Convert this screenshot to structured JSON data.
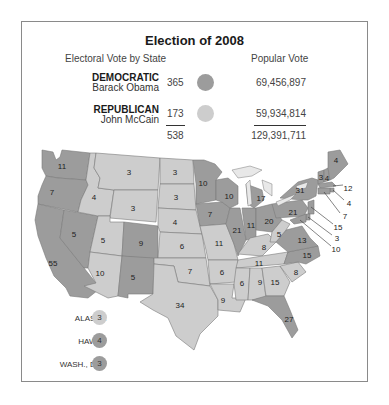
{
  "title": "Election of 2008",
  "header": {
    "electoral_label": "Electoral Vote by State",
    "popular_label": "Popular Vote"
  },
  "colors": {
    "democratic": "#9c9c9c",
    "republican": "#cdcdcd",
    "lake": "#e8e8e8",
    "border": "#7a7a7a"
  },
  "candidates": [
    {
      "party": "DEMOCRATIC",
      "name": "Barack Obama",
      "electoral": "365",
      "popular": "69,456,897"
    },
    {
      "party": "REPUBLICAN",
      "name": "John McCain",
      "electoral": "173",
      "popular": "59,934,814"
    }
  ],
  "totals": {
    "electoral": "538",
    "popular": "129,391,711"
  },
  "insets": [
    {
      "label": "ALASKA",
      "votes": "3",
      "winner": "republican"
    },
    {
      "label": "HAWAII",
      "votes": "4",
      "winner": "democratic"
    },
    {
      "label": "WASH., D.C.",
      "votes": "3",
      "winner": "democratic"
    }
  ],
  "states": [
    {
      "id": "WA",
      "votes": "11",
      "winner": "democratic"
    },
    {
      "id": "OR",
      "votes": "7",
      "winner": "democratic"
    },
    {
      "id": "CA",
      "votes": "55",
      "winner": "democratic"
    },
    {
      "id": "NV",
      "votes": "5",
      "winner": "democratic"
    },
    {
      "id": "ID",
      "votes": "4",
      "winner": "republican"
    },
    {
      "id": "MT",
      "votes": "3",
      "winner": "republican"
    },
    {
      "id": "WY",
      "votes": "3",
      "winner": "republican"
    },
    {
      "id": "UT",
      "votes": "5",
      "winner": "republican"
    },
    {
      "id": "AZ",
      "votes": "10",
      "winner": "republican"
    },
    {
      "id": "CO",
      "votes": "9",
      "winner": "democratic"
    },
    {
      "id": "NM",
      "votes": "5",
      "winner": "democratic"
    },
    {
      "id": "ND",
      "votes": "3",
      "winner": "republican"
    },
    {
      "id": "SD",
      "votes": "3",
      "winner": "republican"
    },
    {
      "id": "NE",
      "votes": "4",
      "winner": "republican"
    },
    {
      "id": "KS",
      "votes": "6",
      "winner": "republican"
    },
    {
      "id": "OK",
      "votes": "7",
      "winner": "republican"
    },
    {
      "id": "TX",
      "votes": "34",
      "winner": "republican"
    },
    {
      "id": "MN",
      "votes": "10",
      "winner": "democratic"
    },
    {
      "id": "IA",
      "votes": "7",
      "winner": "democratic"
    },
    {
      "id": "MO",
      "votes": "11",
      "winner": "republican"
    },
    {
      "id": "AR",
      "votes": "6",
      "winner": "republican"
    },
    {
      "id": "LA",
      "votes": "9",
      "winner": "republican"
    },
    {
      "id": "WI",
      "votes": "10",
      "winner": "democratic"
    },
    {
      "id": "IL",
      "votes": "21",
      "winner": "democratic"
    },
    {
      "id": "MI",
      "votes": "17",
      "winner": "democratic"
    },
    {
      "id": "IN",
      "votes": "11",
      "winner": "democratic"
    },
    {
      "id": "OH",
      "votes": "20",
      "winner": "democratic"
    },
    {
      "id": "KY",
      "votes": "8",
      "winner": "republican"
    },
    {
      "id": "TN",
      "votes": "11",
      "winner": "republican"
    },
    {
      "id": "MS",
      "votes": "6",
      "winner": "republican"
    },
    {
      "id": "AL",
      "votes": "9",
      "winner": "republican"
    },
    {
      "id": "GA",
      "votes": "15",
      "winner": "republican"
    },
    {
      "id": "FL",
      "votes": "27",
      "winner": "democratic"
    },
    {
      "id": "SC",
      "votes": "8",
      "winner": "republican"
    },
    {
      "id": "NC",
      "votes": "15",
      "winner": "democratic"
    },
    {
      "id": "VA",
      "votes": "13",
      "winner": "democratic"
    },
    {
      "id": "WV",
      "votes": "5",
      "winner": "republican"
    },
    {
      "id": "PA",
      "votes": "21",
      "winner": "democratic"
    },
    {
      "id": "NY",
      "votes": "31",
      "winner": "democratic"
    },
    {
      "id": "VT",
      "votes": "3",
      "winner": "democratic"
    },
    {
      "id": "NH",
      "votes": "4",
      "winner": "democratic"
    },
    {
      "id": "ME",
      "votes": "4",
      "winner": "democratic"
    },
    {
      "id": "MA",
      "votes": "12",
      "winner": "democratic"
    },
    {
      "id": "RI",
      "votes": "4",
      "winner": "democratic"
    },
    {
      "id": "CT",
      "votes": "7",
      "winner": "democratic"
    },
    {
      "id": "NJ",
      "votes": "15",
      "winner": "democratic"
    },
    {
      "id": "DE",
      "votes": "3",
      "winner": "democratic"
    },
    {
      "id": "MD",
      "votes": "10",
      "winner": "democratic"
    }
  ]
}
